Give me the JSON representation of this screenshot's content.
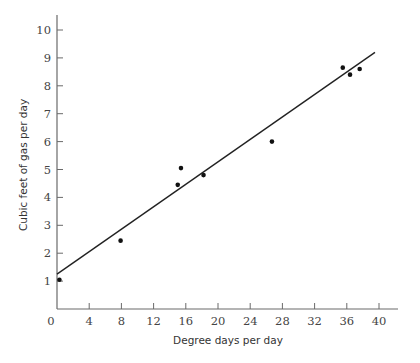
{
  "chart_data": {
    "type": "scatter",
    "title": "",
    "xlabel": "Degree days per day",
    "ylabel": "Cubic feet of gas per day",
    "xlim": [
      0,
      42
    ],
    "ylim": [
      0,
      10.5
    ],
    "xticks": [
      0,
      4,
      8,
      12,
      16,
      20,
      24,
      28,
      32,
      36,
      40
    ],
    "yticks": [
      1,
      2,
      3,
      4,
      5,
      6,
      7,
      8,
      9,
      10
    ],
    "grid": false,
    "legend": null,
    "series": [
      {
        "name": "observations",
        "type": "scatter",
        "points": [
          {
            "x": 0.3,
            "y": 1.05
          },
          {
            "x": 7.9,
            "y": 2.45
          },
          {
            "x": 15.0,
            "y": 4.45
          },
          {
            "x": 15.4,
            "y": 5.05
          },
          {
            "x": 18.2,
            "y": 4.8
          },
          {
            "x": 26.7,
            "y": 6.0
          },
          {
            "x": 35.5,
            "y": 8.65
          },
          {
            "x": 36.4,
            "y": 8.4
          },
          {
            "x": 37.6,
            "y": 8.6
          }
        ]
      },
      {
        "name": "fitted line",
        "type": "line",
        "points": [
          {
            "x": 0,
            "y": 1.25
          },
          {
            "x": 39.5,
            "y": 9.2
          }
        ]
      }
    ]
  }
}
